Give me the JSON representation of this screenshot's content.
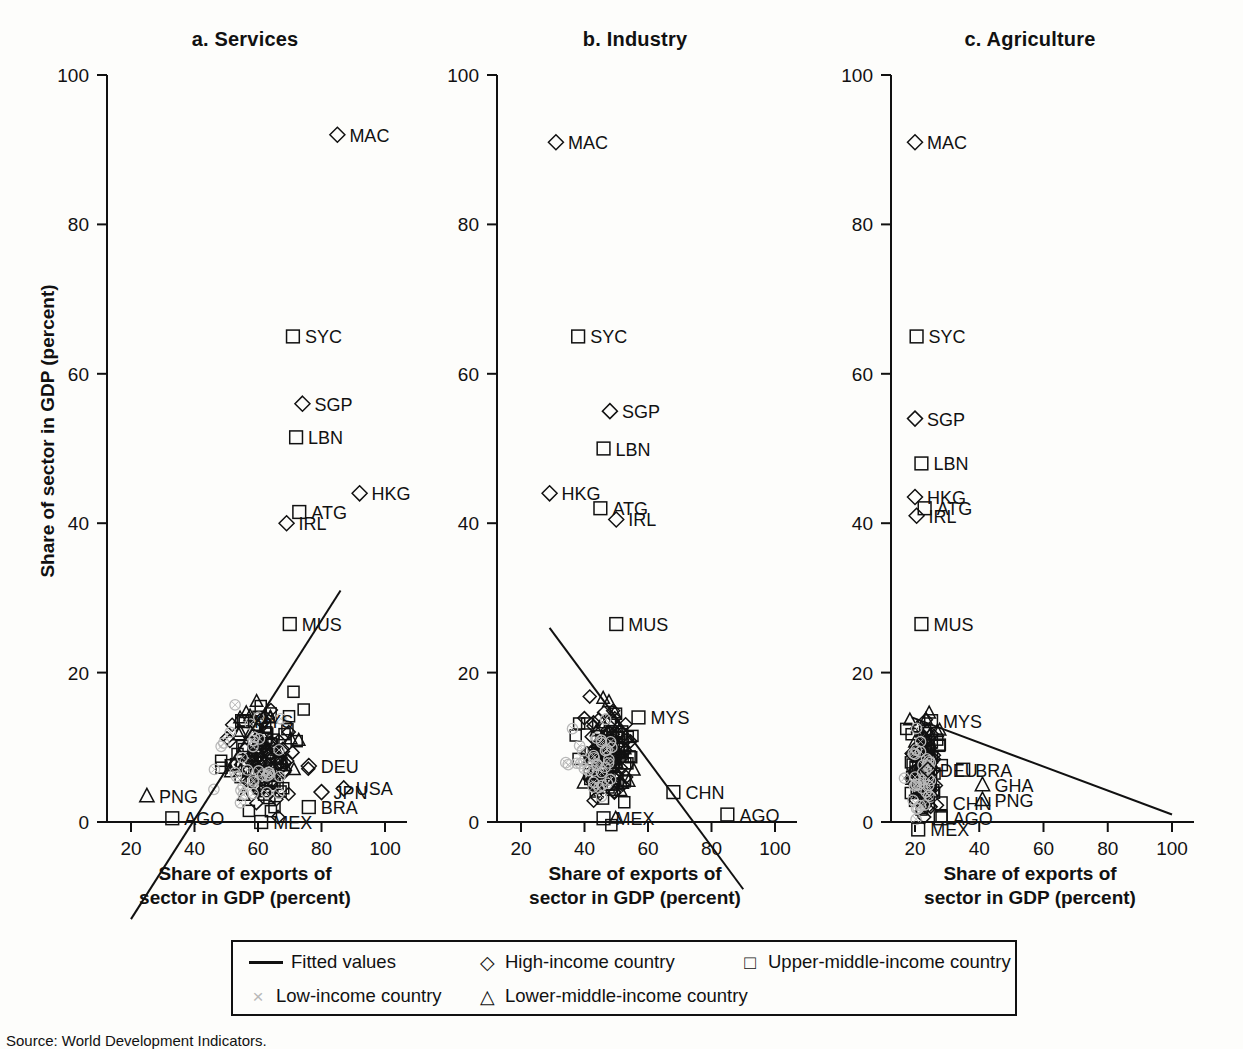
{
  "figure": {
    "y_axis_label": "Share of sector in GDP (percent)",
    "x_axis_label_line1": "Share of exports of",
    "x_axis_label_line2": "sector in GDP (percent)",
    "source": "Source: World Development Indicators."
  },
  "legend": {
    "fitted": "Fitted values",
    "high": "High-income country",
    "upper_middle": "Upper-middle-income country",
    "low": "Low-income country",
    "lower_middle": "Lower-middle-income country",
    "glyph_fitted": "line",
    "glyph_high": "◇",
    "glyph_upper": "□",
    "glyph_low": "×",
    "glyph_lower": "△"
  },
  "colors": {
    "ink": "#111111",
    "low_income": "#b9b9b9",
    "background": "#fdfdfb"
  },
  "chart_data": [
    {
      "type": "scatter",
      "title": "a. Services",
      "xlabel": "Share of exports of sector in GDP (percent)",
      "ylabel": "Share of sector in GDP (percent)",
      "xlim": [
        14,
        106
      ],
      "ylim": [
        -14,
        104
      ],
      "xticks": [
        20,
        40,
        60,
        80,
        100
      ],
      "yticks": [
        0,
        20,
        40,
        60,
        80,
        100
      ],
      "grid": false,
      "legend_position": "below-figure",
      "fitted_line": {
        "x1": 20,
        "y1": -13,
        "x2": 86,
        "y2": 31
      },
      "annotations": [
        "MAC",
        "SYC",
        "SGP",
        "LBN",
        "HKG",
        "ATG",
        "IRL",
        "MUS",
        "MYS",
        "DEU",
        "USA",
        "JPN",
        "BRA",
        "MEX",
        "PNG",
        "AGO"
      ],
      "labeled_points": [
        {
          "label": "MAC",
          "x": 85,
          "y": 92,
          "group": "high"
        },
        {
          "label": "SYC",
          "x": 71,
          "y": 65,
          "group": "upper"
        },
        {
          "label": "SGP",
          "x": 74,
          "y": 56,
          "group": "high"
        },
        {
          "label": "LBN",
          "x": 72,
          "y": 51.5,
          "group": "upper"
        },
        {
          "label": "HKG",
          "x": 92,
          "y": 44,
          "group": "high"
        },
        {
          "label": "ATG",
          "x": 73,
          "y": 41.5,
          "group": "upper"
        },
        {
          "label": "IRL",
          "x": 69,
          "y": 40,
          "group": "high"
        },
        {
          "label": "MUS",
          "x": 70,
          "y": 26.5,
          "group": "upper"
        },
        {
          "label": "MYS",
          "x": 55,
          "y": 13.5,
          "group": "upper"
        },
        {
          "label": "DEU",
          "x": 76,
          "y": 7.5,
          "group": "high"
        },
        {
          "label": "USA",
          "x": 87,
          "y": 4.5,
          "group": "high"
        },
        {
          "label": "JPN",
          "x": 80,
          "y": 4,
          "group": "high"
        },
        {
          "label": "BRA",
          "x": 76,
          "y": 2,
          "group": "upper"
        },
        {
          "label": "MEX",
          "x": 61,
          "y": 0,
          "group": "upper"
        },
        {
          "label": "PNG",
          "x": 25,
          "y": 3.5,
          "group": "lower"
        },
        {
          "label": "AGO",
          "x": 33,
          "y": 0.5,
          "group": "upper"
        }
      ],
      "series": [
        {
          "name": "High-income country",
          "marker": "diamond",
          "n": 66
        },
        {
          "name": "Upper-middle-income country",
          "marker": "square",
          "n": 58
        },
        {
          "name": "Lower-middle-income country",
          "marker": "triangle",
          "n": 38
        },
        {
          "name": "Low-income country",
          "marker": "cross",
          "n": 32
        }
      ],
      "cluster": {
        "x_center": 62,
        "y_center": 8,
        "x_spread": 11,
        "y_spread": 7
      }
    },
    {
      "type": "scatter",
      "title": "b. Industry",
      "xlabel": "Share of exports of sector in GDP (percent)",
      "ylabel": "Share of sector in GDP (percent)",
      "xlim": [
        14,
        106
      ],
      "ylim": [
        -14,
        104
      ],
      "xticks": [
        20,
        40,
        60,
        80,
        100
      ],
      "yticks": [
        0,
        20,
        40,
        60,
        80,
        100
      ],
      "grid": false,
      "legend_position": "below-figure",
      "fitted_line": {
        "x1": 29,
        "y1": 26,
        "x2": 90,
        "y2": -9
      },
      "annotations": [
        "MAC",
        "SYC",
        "SGP",
        "LBN",
        "HKG",
        "ATG",
        "IRL",
        "MUS",
        "MYS",
        "CHN",
        "MEX",
        "AGO"
      ],
      "labeled_points": [
        {
          "label": "MAC",
          "x": 31,
          "y": 91,
          "group": "high"
        },
        {
          "label": "SYC",
          "x": 38,
          "y": 65,
          "group": "upper"
        },
        {
          "label": "SGP",
          "x": 48,
          "y": 55,
          "group": "high"
        },
        {
          "label": "LBN",
          "x": 46,
          "y": 50,
          "group": "upper"
        },
        {
          "label": "HKG",
          "x": 29,
          "y": 44,
          "group": "high"
        },
        {
          "label": "ATG",
          "x": 45,
          "y": 42,
          "group": "upper"
        },
        {
          "label": "IRL",
          "x": 50,
          "y": 40.5,
          "group": "high"
        },
        {
          "label": "MUS",
          "x": 50,
          "y": 26.5,
          "group": "upper"
        },
        {
          "label": "MYS",
          "x": 57,
          "y": 14,
          "group": "upper"
        },
        {
          "label": "CHN",
          "x": 68,
          "y": 4,
          "group": "upper"
        },
        {
          "label": "MEX",
          "x": 46,
          "y": 0.5,
          "group": "upper"
        },
        {
          "label": "AGO",
          "x": 85,
          "y": 1,
          "group": "upper"
        }
      ],
      "series": [
        {
          "name": "High-income country",
          "marker": "diamond",
          "n": 66
        },
        {
          "name": "Upper-middle-income country",
          "marker": "square",
          "n": 58
        },
        {
          "name": "Lower-middle-income country",
          "marker": "triangle",
          "n": 38
        },
        {
          "name": "Low-income country",
          "marker": "cross",
          "n": 32
        }
      ],
      "cluster": {
        "x_center": 47,
        "y_center": 8,
        "x_spread": 9,
        "y_spread": 7
      }
    },
    {
      "type": "scatter",
      "title": "c. Agriculture",
      "xlabel": "Share of exports of sector in GDP (percent)",
      "ylabel": "Share of sector in GDP (percent)",
      "xlim": [
        14,
        106
      ],
      "ylim": [
        -14,
        104
      ],
      "xticks": [
        20,
        40,
        60,
        80,
        100
      ],
      "yticks": [
        0,
        20,
        40,
        60,
        80,
        100
      ],
      "grid": false,
      "legend_position": "below-figure",
      "fitted_line": {
        "x1": 19,
        "y1": 14,
        "x2": 100,
        "y2": 1
      },
      "annotations": [
        "MAC",
        "SYC",
        "SGP",
        "LBN",
        "HKG",
        "ATG",
        "IRL",
        "MUS",
        "MYS",
        "BRA",
        "GHA",
        "PNG",
        "DEU",
        "CHN",
        "AGO",
        "MEX"
      ],
      "labeled_points": [
        {
          "label": "MAC",
          "x": 20,
          "y": 91,
          "group": "high"
        },
        {
          "label": "SYC",
          "x": 20.5,
          "y": 65,
          "group": "upper"
        },
        {
          "label": "SGP",
          "x": 20,
          "y": 54,
          "group": "high"
        },
        {
          "label": "LBN",
          "x": 22,
          "y": 48,
          "group": "upper"
        },
        {
          "label": "HKG",
          "x": 20,
          "y": 43.5,
          "group": "high"
        },
        {
          "label": "ATG",
          "x": 23,
          "y": 42,
          "group": "upper"
        },
        {
          "label": "IRL",
          "x": 20.5,
          "y": 41,
          "group": "high"
        },
        {
          "label": "MUS",
          "x": 22,
          "y": 26.5,
          "group": "upper"
        },
        {
          "label": "MYS",
          "x": 25,
          "y": 13.5,
          "group": "upper"
        },
        {
          "label": "BRA",
          "x": 35,
          "y": 7,
          "group": "upper"
        },
        {
          "label": "GHA",
          "x": 41,
          "y": 5,
          "group": "lower"
        },
        {
          "label": "PNG",
          "x": 41,
          "y": 3,
          "group": "lower"
        },
        {
          "label": "DEU",
          "x": 24,
          "y": 7,
          "group": "high"
        },
        {
          "label": "CHN",
          "x": 28,
          "y": 2.5,
          "group": "upper"
        },
        {
          "label": "AGO",
          "x": 28,
          "y": 0.5,
          "group": "upper"
        },
        {
          "label": "MEX",
          "x": 21,
          "y": -1,
          "group": "upper"
        }
      ],
      "series": [
        {
          "name": "High-income country",
          "marker": "diamond",
          "n": 66
        },
        {
          "name": "Upper-middle-income country",
          "marker": "square",
          "n": 58
        },
        {
          "name": "Lower-middle-income country",
          "marker": "triangle",
          "n": 38
        },
        {
          "name": "Low-income country",
          "marker": "cross",
          "n": 32
        }
      ],
      "cluster": {
        "x_center": 23,
        "y_center": 7,
        "x_spread": 4.5,
        "y_spread": 6
      }
    }
  ]
}
